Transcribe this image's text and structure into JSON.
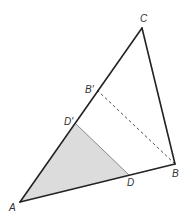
{
  "diagram": {
    "type": "geometry",
    "colors": {
      "stroke": "#222222",
      "shade": "#dcdcdc",
      "shade_edge": "#888888",
      "dashed": "#555555",
      "label": "#333333"
    },
    "points": {
      "A": {
        "label": "A",
        "x": 20,
        "y": 202
      },
      "B": {
        "label": "B",
        "x": 175,
        "y": 164
      },
      "C": {
        "label": "C",
        "x": 142,
        "y": 28
      },
      "B_prime": {
        "label": "B'",
        "x": 97,
        "y": 90
      },
      "D_prime": {
        "label": "D'",
        "x": 76,
        "y": 124
      },
      "D": {
        "label": "D",
        "x": 129,
        "y": 175
      }
    },
    "segments": [
      {
        "from": "A",
        "to": "C",
        "style": "solid"
      },
      {
        "from": "C",
        "to": "B",
        "style": "solid"
      },
      {
        "from": "A",
        "to": "B",
        "style": "solid"
      },
      {
        "from": "D_prime",
        "to": "D",
        "style": "solid-thin"
      },
      {
        "from": "B_prime",
        "to": "B",
        "style": "dashed"
      }
    ],
    "shaded_region": [
      "A",
      "D_prime",
      "D"
    ]
  }
}
